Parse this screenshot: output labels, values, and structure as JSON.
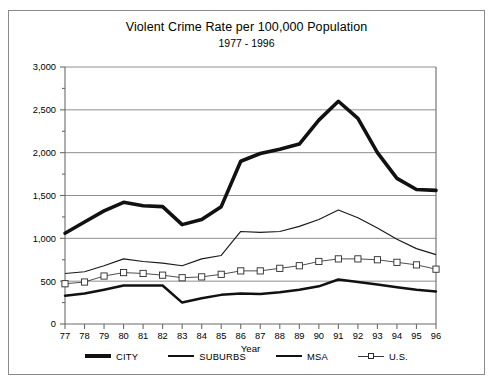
{
  "chart_data": {
    "type": "line",
    "title": "Violent Crime Rate per 100,000 Population",
    "subtitle": "1977 - 1996",
    "xlabel": "Year",
    "ylabel": "",
    "grid": true,
    "legend_position": "bottom",
    "xlim": [
      77,
      96
    ],
    "ylim": [
      0,
      3000
    ],
    "ytick_labels": [
      "0",
      "500",
      "1,000",
      "1,500",
      "2,000",
      "2,500",
      "3,000"
    ],
    "ytick_values": [
      0,
      500,
      1000,
      1500,
      2000,
      2500,
      3000
    ],
    "yminor_step": 250,
    "categories": [
      "77",
      "78",
      "79",
      "80",
      "81",
      "82",
      "83",
      "84",
      "85",
      "86",
      "87",
      "88",
      "89",
      "90",
      "91",
      "92",
      "93",
      "94",
      "95",
      "96"
    ],
    "x": [
      1977,
      1978,
      1979,
      1980,
      1981,
      1982,
      1983,
      1984,
      1985,
      1986,
      1987,
      1988,
      1989,
      1990,
      1991,
      1992,
      1993,
      1994,
      1995,
      1996
    ],
    "series": [
      {
        "name": "CITY",
        "style": "thick-solid",
        "values": [
          1060,
          1190,
          1320,
          1420,
          1380,
          1370,
          1160,
          1220,
          1370,
          1900,
          1990,
          2040,
          2100,
          2380,
          2600,
          2400,
          2000,
          1700,
          1570,
          1560
        ]
      },
      {
        "name": "SUBURBS",
        "style": "medium-solid",
        "values": [
          330,
          355,
          400,
          450,
          450,
          450,
          250,
          300,
          340,
          355,
          350,
          370,
          400,
          440,
          520,
          490,
          460,
          430,
          400,
          380
        ]
      },
      {
        "name": "MSA",
        "style": "thin-solid",
        "values": [
          590,
          610,
          680,
          760,
          730,
          710,
          680,
          760,
          800,
          1080,
          1070,
          1080,
          1140,
          1220,
          1330,
          1240,
          1120,
          990,
          880,
          810
        ]
      },
      {
        "name": "U.S.",
        "style": "thin-square-markers",
        "values": [
          470,
          490,
          560,
          600,
          590,
          570,
          540,
          550,
          580,
          620,
          620,
          650,
          680,
          730,
          760,
          760,
          750,
          720,
          690,
          640
        ]
      }
    ]
  },
  "legend": {
    "items": [
      {
        "label": "CITY",
        "marker": "thick-line"
      },
      {
        "label": "SUBURBS",
        "marker": "medium-line"
      },
      {
        "label": "MSA",
        "marker": "thin-line"
      },
      {
        "label": "U.S.",
        "marker": "thin-line-square"
      }
    ]
  }
}
